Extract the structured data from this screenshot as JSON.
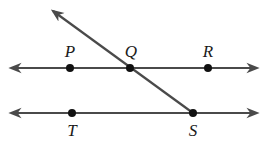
{
  "diagram": {
    "title": "",
    "colors": {
      "line": "#4a4a4a",
      "point": "#111111",
      "label": "#1a1a1a",
      "background": "#ffffff"
    },
    "lines": [
      {
        "id": "line-PR",
        "name": "upper-parallel-line",
        "from": [
          11,
          68
        ],
        "to": [
          257,
          68
        ],
        "arrows": "both"
      },
      {
        "id": "line-TS",
        "name": "lower-parallel-line",
        "from": [
          11,
          113
        ],
        "to": [
          257,
          113
        ],
        "arrows": "both"
      },
      {
        "id": "ray-SQ",
        "name": "transversal-ray",
        "from": [
          193,
          113
        ],
        "to": [
          53,
          11
        ],
        "arrows": "end"
      }
    ],
    "points": [
      {
        "label": "P",
        "x": 70,
        "y": 68,
        "label_x": 70,
        "label_y": 57
      },
      {
        "label": "Q",
        "x": 130,
        "y": 68,
        "label_x": 131,
        "label_y": 57
      },
      {
        "label": "R",
        "x": 208,
        "y": 68,
        "label_x": 208,
        "label_y": 57
      },
      {
        "label": "T",
        "x": 72,
        "y": 113,
        "label_x": 72,
        "label_y": 136
      },
      {
        "label": "S",
        "x": 193,
        "y": 113,
        "label_x": 193,
        "label_y": 136
      }
    ]
  }
}
